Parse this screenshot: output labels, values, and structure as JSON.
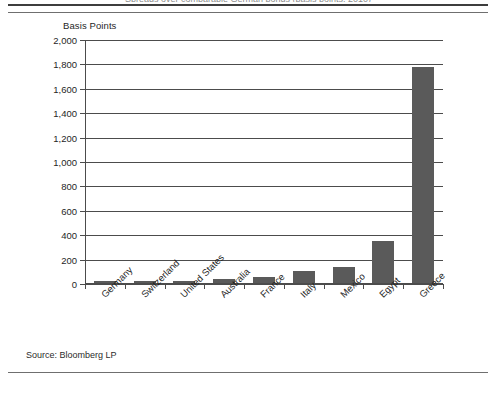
{
  "figure": {
    "title": "Spreads over comparable German bonds (basis points, 2010)",
    "source": "Source: Bloomberg LP"
  },
  "chart_data": {
    "type": "bar",
    "title": "Spreads over comparable German bonds (basis points, 2010)",
    "xlabel": "",
    "ylabel": "Basis Points",
    "ylim": [
      0,
      2000
    ],
    "ytick_labels": [
      "0",
      "200",
      "400",
      "600",
      "800",
      "1,000",
      "1,200",
      "1,400",
      "1,600",
      "1,800",
      "2,000"
    ],
    "ytick_values": [
      0,
      200,
      400,
      600,
      800,
      1000,
      1200,
      1400,
      1600,
      1800,
      2000
    ],
    "grid": true,
    "legend": "none",
    "categories": [
      "Germany",
      "Switzerland",
      "United States",
      "Australia",
      "France",
      "Italy",
      "Mexico",
      "Egypt",
      "Greece"
    ],
    "values": [
      12,
      15,
      20,
      35,
      50,
      100,
      130,
      345,
      1770
    ],
    "bar_color": "#5a5a5a",
    "axis_color": "#4c4c4c"
  }
}
